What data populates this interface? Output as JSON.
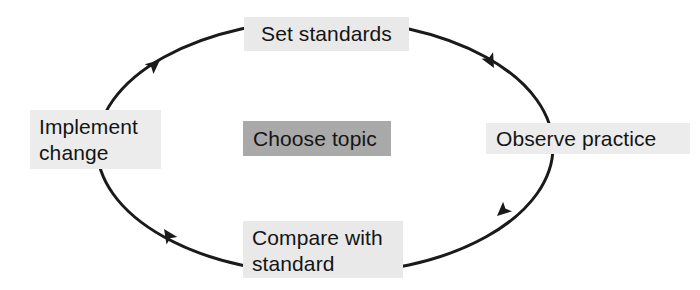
{
  "diagram": {
    "type": "cycle",
    "direction": "clockwise",
    "colors": {
      "node_fill_light": "#e9e9e9",
      "node_fill_dark": "#a9a9a9",
      "ring_stroke": "#1a1a1a",
      "text": "#141414",
      "background": "#ffffff"
    },
    "ring": {
      "shape": "ellipse",
      "center_x": 325,
      "center_y": 147,
      "radius_x": 228,
      "radius_y": 127,
      "stroke_width": 3
    },
    "center_node": {
      "label": "Choose topic",
      "fill": "#a9a9a9"
    },
    "nodes": [
      {
        "id": "set-standards",
        "label": "Set standards",
        "position": "top",
        "fill": "#e9e9e9"
      },
      {
        "id": "observe-practice",
        "label": "Observe practice",
        "position": "right",
        "fill": "#ececec"
      },
      {
        "id": "compare-with-standard",
        "label": "Compare with\nstandard",
        "position": "bottom",
        "fill": "#e9e9e9"
      },
      {
        "id": "implement-change",
        "label": "Implement\nchange",
        "position": "left",
        "fill": "#ececec"
      }
    ],
    "arrows": [
      {
        "id": "arrow-top-right",
        "from": "set-standards",
        "to": "observe-practice",
        "x": 492,
        "y": 66,
        "angle": 52
      },
      {
        "id": "arrow-bottom-right",
        "from": "observe-practice",
        "to": "compare-with-standard",
        "x": 498,
        "y": 215,
        "angle": 128
      },
      {
        "id": "arrow-bottom-left",
        "from": "compare-with-standard",
        "to": "implement-change",
        "x": 166,
        "y": 228,
        "angle": 226
      },
      {
        "id": "arrow-top-left",
        "from": "implement-change",
        "to": "set-standards",
        "x": 158,
        "y": 61,
        "angle": 310
      }
    ]
  }
}
